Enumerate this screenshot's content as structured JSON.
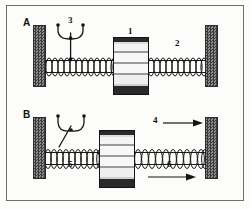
{
  "figure": {
    "panels": [
      {
        "letter": "A",
        "labels": [
          {
            "id": "block-label-1",
            "text": "1"
          },
          {
            "id": "right-spring-label-2",
            "text": "2"
          },
          {
            "id": "callout-label-3",
            "text": "3"
          }
        ]
      },
      {
        "letter": "B",
        "labels": [
          {
            "id": "upper-arrow-label-4",
            "text": "4"
          },
          {
            "id": "left-spring-label-5",
            "text": "5"
          },
          {
            "id": "lower-arrow-label-6",
            "text": "6"
          }
        ]
      }
    ],
    "icons": {
      "left_wall": "hatched-wall-icon",
      "right_wall": "hatched-wall-icon",
      "spring": "coil-spring-icon",
      "mass": "striped-mass-block-icon",
      "arrow": "right-arrow-icon",
      "callout": "multi-leader-pointer-icon"
    },
    "colors": {
      "ink": "#141414",
      "wall_dark": "#3a3a3a",
      "wall_light": "#8e8e8e",
      "paper": "#fdfdfb",
      "frame": "#6e6e6e"
    }
  }
}
